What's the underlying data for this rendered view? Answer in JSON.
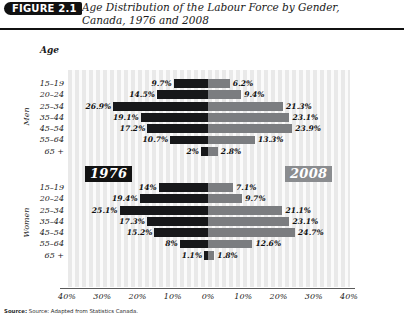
{
  "header": {
    "figure_badge": "FIGURE 2.1",
    "title_line1": "Age Distribution of the Labour Force by Gender,",
    "title_line2": "Canada, 1976 and 2008"
  },
  "axis_title": "Age",
  "badges": {
    "left_year": "1976",
    "right_year": "2008"
  },
  "gender_labels": {
    "men": "Men",
    "women": "Women"
  },
  "source": "Source: Adapted from Statistics Canada.",
  "colors": {
    "left_bar": "#17181a",
    "right_bar": "#7b7d80",
    "badge_left": "#121212",
    "badge_right": "#8a8c8f",
    "stripe_dark": "#e9e9e9",
    "stripe_light": "#fbfbfb"
  },
  "chart_data": {
    "type": "bar",
    "title": "Age Distribution of the Labour Force by Gender, Canada, 1976 and 2008",
    "xlabel": "",
    "ylabel": "Age",
    "orientation": "horizontal-diverging",
    "grid": true,
    "legend_position": "in-plot",
    "xlim": [
      -40,
      40
    ],
    "xticks": [
      "40%",
      "30%",
      "20%",
      "10%",
      "0%",
      "10%",
      "20%",
      "30%",
      "40%"
    ],
    "xtick_values": [
      -40,
      -30,
      -20,
      -10,
      0,
      10,
      20,
      30,
      40
    ],
    "categories": [
      "15–19",
      "20–24",
      "25–34",
      "35–44",
      "45–54",
      "55–64",
      "65 +"
    ],
    "panels": [
      {
        "name": "Men",
        "series": [
          {
            "name": "1976",
            "side": "left",
            "values": [
              9.7,
              14.5,
              26.9,
              19.1,
              17.2,
              10.7,
              2.0
            ],
            "labels": [
              "9.7%",
              "14.5%",
              "26.9%",
              "19.1%",
              "17.2%",
              "10.7%",
              "2%"
            ]
          },
          {
            "name": "2008",
            "side": "right",
            "values": [
              6.2,
              9.4,
              21.3,
              23.1,
              23.9,
              13.3,
              2.8
            ],
            "labels": [
              "6.2%",
              "9.4%",
              "21.3%",
              "23.1%",
              "23.9%",
              "13.3%",
              "2.8%"
            ]
          }
        ]
      },
      {
        "name": "Women",
        "series": [
          {
            "name": "1976",
            "side": "left",
            "values": [
              14.0,
              19.4,
              25.1,
              17.3,
              15.2,
              8.0,
              1.1
            ],
            "labels": [
              "14%",
              "19.4%",
              "25.1%",
              "17.3%",
              "15.2%",
              "8%",
              "1.1%"
            ]
          },
          {
            "name": "2008",
            "side": "right",
            "values": [
              7.1,
              9.7,
              21.1,
              23.1,
              24.7,
              12.6,
              1.8
            ],
            "labels": [
              "7.1%",
              "9.7%",
              "21.1%",
              "23.1%",
              "24.7%",
              "12.6%",
              "1.8%"
            ]
          }
        ]
      }
    ]
  }
}
